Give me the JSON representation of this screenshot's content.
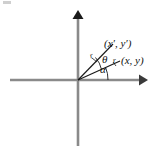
{
  "figure": {
    "background_color": "#ffffff",
    "axis_color": "#808080",
    "ray_color": "#1a1a1a",
    "labels": {
      "point_rotated": "(x′, y′)",
      "point_original": "(x, y)",
      "angle_theta": "θ",
      "angle_alpha": "α",
      "radius_upper": "r",
      "radius_lower": "r"
    },
    "axes": {
      "origin": {
        "x": 78,
        "y": 80
      },
      "x_axis": {
        "left_end": 10,
        "right_end": 145,
        "arrow_at": "right"
      },
      "y_axis": {
        "top_end": 12,
        "bottom_end": 146,
        "arrow_at": "top"
      }
    },
    "geometry": {
      "ray_original": {
        "from": [
          78,
          80
        ],
        "to": [
          119,
          61
        ],
        "angle_from_x_axis_deg": 25,
        "label": "(x, y)"
      },
      "ray_rotated": {
        "from": [
          78,
          80
        ],
        "to": [
          112,
          45
        ],
        "angle_from_x_axis_deg": 46,
        "label": "(x′, y′)"
      },
      "arc_alpha": {
        "between": [
          "x-axis",
          "ray_original"
        ],
        "label": "α"
      },
      "arc_theta": {
        "between": [
          "ray_original",
          "ray_rotated"
        ],
        "label": "θ"
      },
      "radius_length": "r"
    }
  }
}
